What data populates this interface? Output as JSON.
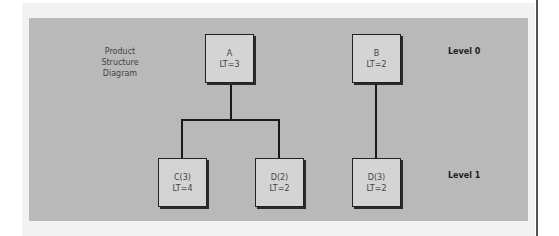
{
  "diagram": {
    "title_lines": [
      "Product",
      "Structure",
      "Diagram"
    ],
    "levels": [
      {
        "label": "Level 0"
      },
      {
        "label": "Level 1"
      }
    ],
    "nodes": [
      {
        "id": "A",
        "name": "A",
        "lead_time": "LT=3",
        "level": 0
      },
      {
        "id": "B",
        "name": "B",
        "lead_time": "LT=2",
        "level": 0
      },
      {
        "id": "C",
        "name": "C(3)",
        "lead_time": "LT=4",
        "level": 1,
        "parent": "A"
      },
      {
        "id": "D2",
        "name": "D(2)",
        "lead_time": "LT=2",
        "level": 1,
        "parent": "A"
      },
      {
        "id": "D3",
        "name": "D(3)",
        "lead_time": "LT=2",
        "level": 1,
        "parent": "B"
      }
    ],
    "colors": {
      "panel": "#b9b9b9",
      "node_fill": "#d4d4d4",
      "line": "#1a1a1a"
    }
  }
}
